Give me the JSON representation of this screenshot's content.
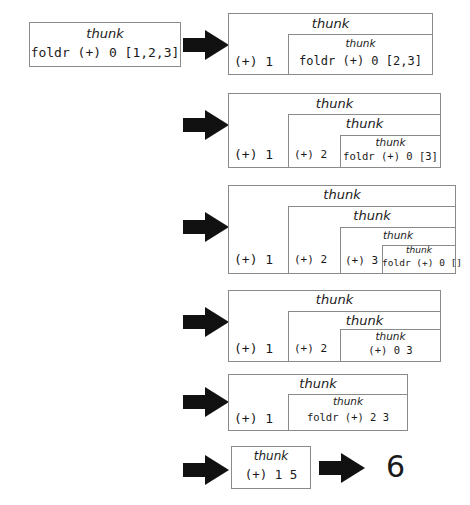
{
  "diagram": {
    "colors": {
      "box_border": "#8a8a8a",
      "arrow": "#111111",
      "text": "#1a1a1a",
      "background": "#ffffff"
    },
    "thunk_label": "thunk",
    "arrow_icon": "right-block-arrow",
    "steps": [
      {
        "id": "step-0",
        "expression": "foldr (+) 0 [1,2,3]",
        "cells": [],
        "result": null
      },
      {
        "id": "step-1",
        "expression": "foldr (+) 0 [2,3]",
        "cells": [
          "(+) 1"
        ],
        "result": null
      },
      {
        "id": "step-2",
        "expression": "foldr (+) 0 [3]",
        "cells": [
          "(+) 1",
          "(+) 2"
        ],
        "result": null
      },
      {
        "id": "step-3",
        "expression": "foldr (+) 0 []",
        "cells": [
          "(+) 1",
          "(+) 2",
          "(+) 3"
        ],
        "result": null
      },
      {
        "id": "step-4",
        "expression": "(+) 0 3",
        "cells": [
          "(+) 1",
          "(+) 2"
        ],
        "result": null
      },
      {
        "id": "step-5",
        "expression": "foldr (+) 2 3",
        "cells": [
          "(+) 1"
        ],
        "result": null
      },
      {
        "id": "step-6",
        "expression": "(+) 1 5",
        "cells": [],
        "result": "6"
      }
    ],
    "final_result": "6"
  }
}
